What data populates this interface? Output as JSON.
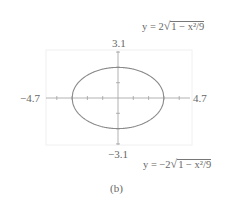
{
  "figure": {
    "caption": "(b)",
    "equation_top": {
      "prefix": "y = 2",
      "radicand": "1 − x²/9"
    },
    "equation_bottom": {
      "prefix": "y = −2",
      "radicand": "1 − x²/9"
    },
    "axis_labels": {
      "xmin": "−4.7",
      "xmax": "4.7",
      "ymax": "3.1",
      "ymin": "−3.1"
    },
    "colors": {
      "curve": "#8a8a8a",
      "axis": "#9a9a9a",
      "window": "#eeeeee"
    }
  },
  "chart_data": {
    "type": "line",
    "title": "",
    "caption": "(b)",
    "xlabel": "",
    "ylabel": "",
    "xlim": [
      -4.7,
      4.7
    ],
    "ylim": [
      -3.1,
      3.1
    ],
    "grid": false,
    "x_ticks": [
      -4,
      -3,
      -2,
      -1,
      0,
      1,
      2,
      3,
      4
    ],
    "y_ticks": [
      -3,
      -2,
      -1,
      0,
      1,
      2,
      3
    ],
    "series": [
      {
        "name": "y = 2√(1 − x²/9)",
        "x": [
          -3,
          -2.5,
          -2,
          -1.5,
          -1,
          -0.5,
          0,
          0.5,
          1,
          1.5,
          2,
          2.5,
          3
        ],
        "values": [
          0,
          1.11,
          1.49,
          1.73,
          1.89,
          1.97,
          2,
          1.97,
          1.89,
          1.73,
          1.49,
          1.11,
          0
        ]
      },
      {
        "name": "y = −2√(1 − x²/9)",
        "x": [
          -3,
          -2.5,
          -2,
          -1.5,
          -1,
          -0.5,
          0,
          0.5,
          1,
          1.5,
          2,
          2.5,
          3
        ],
        "values": [
          0,
          -1.11,
          -1.49,
          -1.73,
          -1.89,
          -1.97,
          -2,
          -1.97,
          -1.89,
          -1.73,
          -1.49,
          -1.11,
          0
        ]
      }
    ],
    "annotations": [
      "y = 2√(1 − x²/9)",
      "y = −2√(1 − x²/9)"
    ],
    "axis_end_labels": {
      "xmin": "−4.7",
      "xmax": "4.7",
      "ymin": "−3.1",
      "ymax": "3.1"
    }
  }
}
